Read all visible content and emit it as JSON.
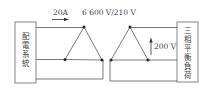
{
  "diagram": {
    "left_block": {
      "label": "配電系統",
      "chars": [
        "配",
        "電",
        "系",
        "統"
      ]
    },
    "right_block": {
      "label": "三相平衡負荷",
      "chars": [
        "三",
        "相",
        "平",
        "衡",
        "負",
        "荷"
      ]
    },
    "current_label": "20A",
    "transformer_ratio_label": "6 600 V/210 V",
    "load_voltage_label": "200 V",
    "connection": "delta-delta"
  }
}
